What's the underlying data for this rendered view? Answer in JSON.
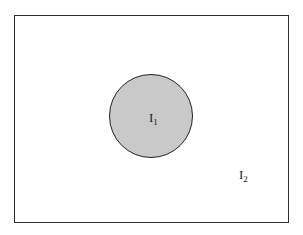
{
  "diagram": {
    "type": "set-region-diagram",
    "outer_region": {
      "label": "I",
      "subscript": "2",
      "shape": "rectangle",
      "fill": "#ffffff",
      "stroke": "#2e2e2e"
    },
    "inner_region": {
      "label": "I",
      "subscript": "1",
      "shape": "circle",
      "fill": "#c9c9c9",
      "stroke": "#222222"
    }
  }
}
